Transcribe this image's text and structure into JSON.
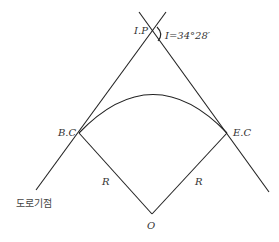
{
  "diagram": {
    "type": "horizontal-circular-curve",
    "labels": {
      "ip": "I.P",
      "angle": "I=34°28′",
      "bc": "B.C",
      "ec": "E.C",
      "radius_left": "R",
      "radius_right": "R",
      "center": "O",
      "road_start": "도로기점"
    },
    "intersection_angle": "34°28′",
    "colors": {
      "line": "#222222",
      "text": "#333333",
      "background": "#ffffff"
    }
  }
}
